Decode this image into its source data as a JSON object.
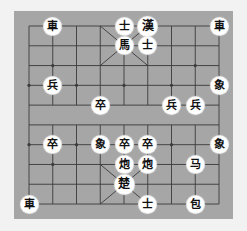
{
  "board": {
    "colors": {
      "background": "#f2f2f2",
      "board": "#a6a6a6",
      "lines": "#3a3a3a",
      "piece_face": "#ffffff",
      "piece_text": "#111111"
    },
    "grid": {
      "cols": 9,
      "rows": 10,
      "x0": 29,
      "y0": 26,
      "dx": 23.75,
      "dy": 19.78
    },
    "pieces": [
      {
        "id": "top-chariot-left",
        "label": "車",
        "col": 1,
        "row": 0
      },
      {
        "id": "top-advisor-a",
        "label": "士",
        "col": 4,
        "row": 0
      },
      {
        "id": "top-general",
        "label": "漢",
        "col": 5,
        "row": 0,
        "large": true
      },
      {
        "id": "top-chariot-right",
        "label": "車",
        "col": 8,
        "row": 0
      },
      {
        "id": "top-horse",
        "label": "馬",
        "col": 4,
        "row": 1
      },
      {
        "id": "top-advisor-b",
        "label": "士",
        "col": 5,
        "row": 1
      },
      {
        "id": "top-elephant",
        "label": "象",
        "col": 8,
        "row": 3
      },
      {
        "id": "soldier-3-1",
        "label": "兵",
        "col": 1,
        "row": 3
      },
      {
        "id": "soldier-4-3",
        "label": "卒",
        "col": 3,
        "row": 4
      },
      {
        "id": "soldier-4-6",
        "label": "兵",
        "col": 6,
        "row": 4
      },
      {
        "id": "soldier-4-7",
        "label": "兵",
        "col": 7,
        "row": 4
      },
      {
        "id": "soldier-6-1",
        "label": "卒",
        "col": 1,
        "row": 6
      },
      {
        "id": "elephant-6-3",
        "label": "象",
        "col": 3,
        "row": 6
      },
      {
        "id": "soldier-6-4",
        "label": "卒",
        "col": 4,
        "row": 6
      },
      {
        "id": "soldier-6-5",
        "label": "卒",
        "col": 5,
        "row": 6
      },
      {
        "id": "elephant-6-8",
        "label": "象",
        "col": 8,
        "row": 6
      },
      {
        "id": "cannon-7-4",
        "label": "炮",
        "col": 4,
        "row": 7
      },
      {
        "id": "cannon-7-5",
        "label": "炮",
        "col": 5,
        "row": 7
      },
      {
        "id": "horse-7-7",
        "label": "马",
        "col": 7,
        "row": 7
      },
      {
        "id": "bottom-general",
        "label": "楚",
        "col": 4,
        "row": 8,
        "large": true
      },
      {
        "id": "bottom-chariot",
        "label": "車",
        "col": 0,
        "row": 9
      },
      {
        "id": "bottom-advisor",
        "label": "士",
        "col": 5,
        "row": 9
      },
      {
        "id": "bottom-cannon",
        "label": "包",
        "col": 7,
        "row": 9
      }
    ]
  }
}
